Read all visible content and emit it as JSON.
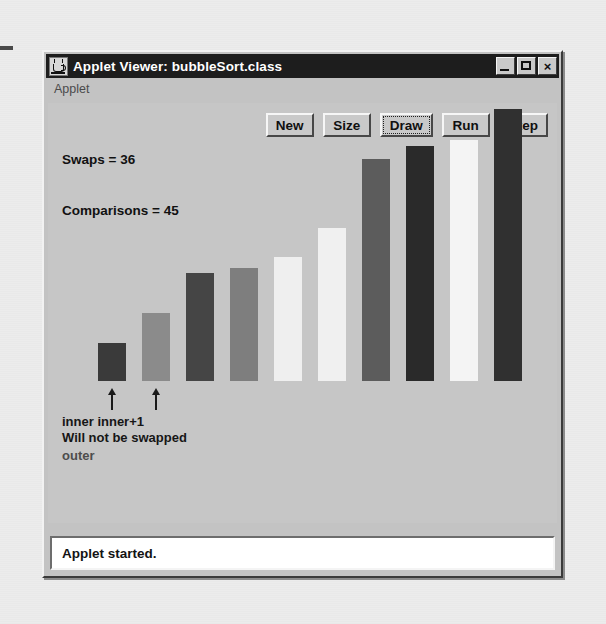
{
  "window": {
    "title": "Applet Viewer: bubbleSort.class",
    "icon": "java-coffee-cup-icon",
    "minimize_label": "",
    "maximize_label": "",
    "close_label": "×"
  },
  "menubar": {
    "items": [
      {
        "label": "Applet"
      }
    ]
  },
  "applet": {
    "stats": {
      "swaps_line": "Swaps = 36",
      "comparisons_line": "Comparisons = 45",
      "swaps": 36,
      "comparisons": 45
    },
    "buttons": [
      {
        "label": "New",
        "focused": false
      },
      {
        "label": "Size",
        "focused": false
      },
      {
        "label": "Draw",
        "focused": true
      },
      {
        "label": "Run",
        "focused": false
      },
      {
        "label": "Step",
        "focused": false
      }
    ],
    "annotations": {
      "pointer_labels": "inner inner+1",
      "message": "Will not be swapped",
      "outer_label": "outer",
      "arrows": [
        {
          "target_bar": 1
        },
        {
          "target_bar": 2
        }
      ]
    }
  },
  "statusbar": {
    "text": "Applet started."
  },
  "colors": {
    "titlebar_bg": "#1d1d1d",
    "titlebar_text": "#ffffff",
    "window_face": "#c3c3c3",
    "canvas_bg": "#c6c6c6",
    "status_bg": "#ffffff",
    "text": "#111111"
  },
  "chart_data": {
    "type": "bar",
    "title": "",
    "xlabel": "",
    "ylabel": "",
    "grid": false,
    "legend": "none",
    "categories": [
      "0",
      "1",
      "2",
      "3",
      "4",
      "5",
      "6",
      "7",
      "8",
      "9"
    ],
    "values": [
      38,
      68,
      108,
      113,
      124,
      153,
      222,
      235,
      241,
      272
    ],
    "ylim": [
      0,
      280
    ],
    "colors": [
      "#3a3a3a",
      "#8b8b8b",
      "#454545",
      "#7e7e7e",
      "#efefef",
      "#f0f0f0",
      "#5c5c5c",
      "#2a2a2a",
      "#f4f4f4",
      "#303030"
    ],
    "bar_width": 28,
    "bar_gap": 16
  }
}
